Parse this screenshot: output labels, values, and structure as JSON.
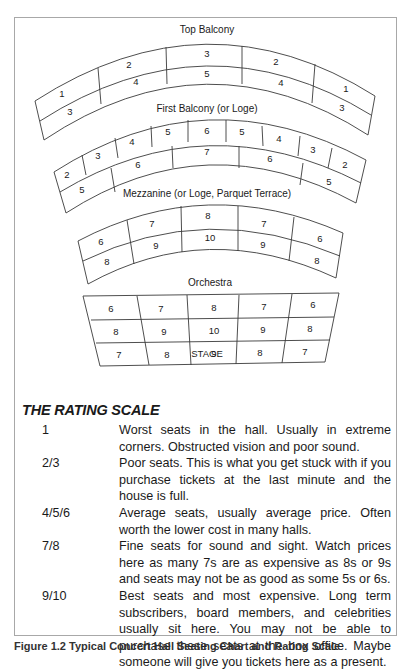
{
  "diagram": {
    "sections": {
      "top_balcony": {
        "label": "Top Balcony",
        "outer_row": [
          "1",
          "2",
          "3",
          "2",
          "1"
        ],
        "inner_row": [
          "3",
          "4",
          "5",
          "4",
          "3"
        ]
      },
      "first_balcony": {
        "label": "First Balcony (or Loge)",
        "outer_row": [
          "2",
          "3",
          "4",
          "5",
          "6",
          "5",
          "4",
          "3",
          "2"
        ],
        "inner_row": [
          "5",
          "6",
          "7",
          "6",
          "5"
        ]
      },
      "mezzanine": {
        "label": "Mezzanine (or Loge, Parquet Terrace)",
        "outer_row": [
          "6",
          "7",
          "8",
          "7",
          "6"
        ],
        "inner_row": [
          "8",
          "9",
          "10",
          "9",
          "8"
        ]
      },
      "orchestra": {
        "label": "Orchestra",
        "rows": [
          [
            "6",
            "7",
            "8",
            "7",
            "6"
          ],
          [
            "8",
            "9",
            "10",
            "9",
            "8"
          ],
          [
            "7",
            "8",
            "9",
            "8",
            "7"
          ]
        ]
      }
    },
    "stage_label": "STAGE",
    "colors": {
      "line": "#3a3a3a",
      "frame": "#a8a8a8",
      "text": "#1a1a1a"
    }
  },
  "rating_scale": {
    "heading": "THE RATING SCALE",
    "items": [
      {
        "rating": "1",
        "description": "Worst seats in the hall. Usually in extreme corners. Obstructed vision and poor sound."
      },
      {
        "rating": "2/3",
        "description": "Poor seats. This is what you get stuck with if you purchase tickets at the last minute and the house is full."
      },
      {
        "rating": "4/5/6",
        "description": "Average seats, usually average price. Often worth the lower cost in many halls."
      },
      {
        "rating": "7/8",
        "description": "Fine seats for sound and sight. Watch prices here as many 7s are as expensive as 8s or 9s and seats may not be as good as some 5s or 6s."
      },
      {
        "rating": "9/10",
        "description": "Best seats and most expensive. Long term subscribers, board members, and celebrities usually sit here. You may not be able to purchase these seats at the box office. Maybe someone will give you tickets here as a present."
      }
    ]
  },
  "caption": "Figure 1.2  Typical Concert Hall Seating Chart and Rating Scale"
}
